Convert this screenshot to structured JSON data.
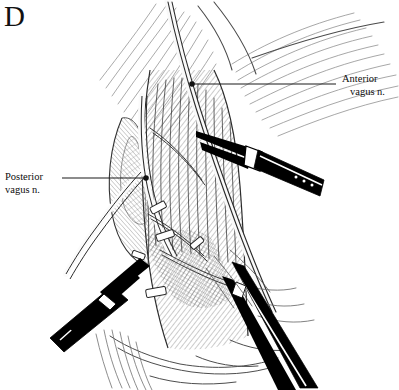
{
  "figure": {
    "panel_letter": "D",
    "type": "surgical-line-illustration",
    "style": "pen-and-ink hatched medical illustration, black on white"
  },
  "labels": {
    "posterior": {
      "line1": "Posterior",
      "line2": "vagus n."
    },
    "anterior": {
      "line1": "Anterior",
      "line2": "vagus n."
    }
  },
  "leaders": {
    "posterior": {
      "from_x": 62,
      "from_y": 178,
      "to_x": 146,
      "to_y": 178,
      "dot_r": 2.8
    },
    "anterior": {
      "from_x": 336,
      "from_y": 84,
      "to_x": 192,
      "to_y": 84,
      "dot_r": 2.8
    }
  },
  "instruments": [
    {
      "name": "upper-right-grasper",
      "tip_x": 196,
      "tip_y": 131,
      "exit_x": 322,
      "exit_y": 190
    },
    {
      "name": "lower-left-grasper",
      "tip_x": 140,
      "tip_y": 258,
      "exit_x": 58,
      "exit_y": 330
    },
    {
      "name": "lower-right-grasper",
      "tip_x": 232,
      "tip_y": 262,
      "exit_x": 318,
      "exit_y": 388
    }
  ],
  "colors": {
    "ink": "#111111",
    "instrument_fill": "#000000",
    "hatch": "#3a3a3a",
    "light_hatch": "#7a7a7a",
    "background": "#ffffff"
  }
}
